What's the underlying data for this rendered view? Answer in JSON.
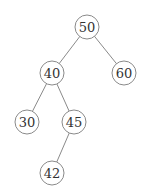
{
  "diagram": {
    "type": "binary-search-tree",
    "nodes": [
      {
        "id": "n50",
        "label": "50",
        "x": 87,
        "y": 27
      },
      {
        "id": "n40",
        "label": "40",
        "x": 52,
        "y": 73
      },
      {
        "id": "n60",
        "label": "60",
        "x": 124,
        "y": 73
      },
      {
        "id": "n30",
        "label": "30",
        "x": 27,
        "y": 122
      },
      {
        "id": "n45",
        "label": "45",
        "x": 74,
        "y": 122
      },
      {
        "id": "n42",
        "label": "42",
        "x": 52,
        "y": 173
      }
    ],
    "edges": [
      {
        "from": "n50",
        "to": "n40"
      },
      {
        "from": "n50",
        "to": "n60"
      },
      {
        "from": "n40",
        "to": "n30"
      },
      {
        "from": "n40",
        "to": "n45"
      },
      {
        "from": "n45",
        "to": "n42"
      }
    ],
    "radius": 12
  }
}
